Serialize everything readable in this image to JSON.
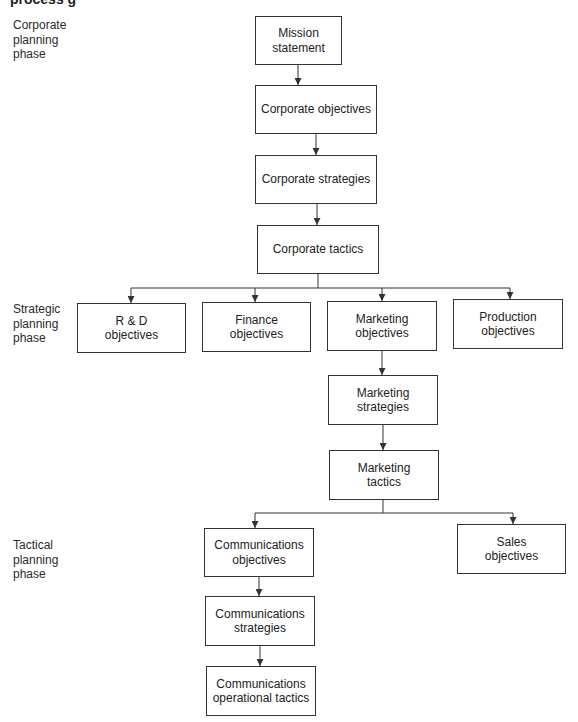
{
  "caption": {
    "visible_fragment": "process                    g"
  },
  "phases": {
    "corporate": "Corporate planning phase",
    "strategic": "Strategic planning phase",
    "tactical": "Tactical planning phase"
  },
  "nodes": {
    "mission_statement": "Mission statement",
    "corporate_objectives": "Corporate objectives",
    "corporate_strategies": "Corporate strategies",
    "corporate_tactics": "Corporate tactics",
    "rd_objectives": "R & D objectives",
    "finance_objectives": "Finance objectives",
    "marketing_objectives": "Marketing objectives",
    "production_objectives": "Production objectives",
    "marketing_strategies": "Marketing strategies",
    "marketing_tactics": "Marketing tactics",
    "communications_objectives": "Communications objectives",
    "sales_objectives": "Sales objectives",
    "communications_strategies": "Communications strategies",
    "communications_operational_tactics": "Communications operational tactics"
  },
  "edges": [
    [
      "mission_statement",
      "corporate_objectives"
    ],
    [
      "corporate_objectives",
      "corporate_strategies"
    ],
    [
      "corporate_strategies",
      "corporate_tactics"
    ],
    [
      "corporate_tactics",
      "rd_objectives"
    ],
    [
      "corporate_tactics",
      "finance_objectives"
    ],
    [
      "corporate_tactics",
      "marketing_objectives"
    ],
    [
      "corporate_tactics",
      "production_objectives"
    ],
    [
      "marketing_objectives",
      "marketing_strategies"
    ],
    [
      "marketing_strategies",
      "marketing_tactics"
    ],
    [
      "marketing_tactics",
      "communications_objectives"
    ],
    [
      "marketing_tactics",
      "sales_objectives"
    ],
    [
      "communications_objectives",
      "communications_strategies"
    ],
    [
      "communications_strategies",
      "communications_operational_tactics"
    ]
  ]
}
